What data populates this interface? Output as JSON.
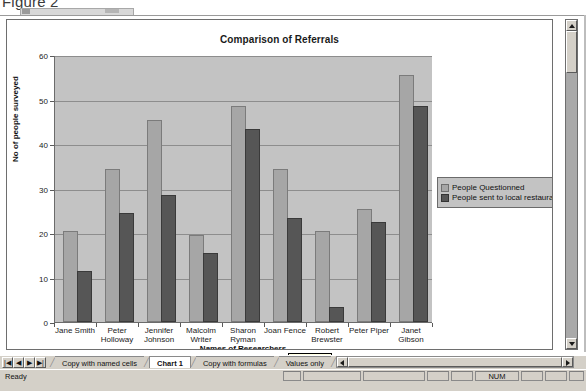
{
  "figure": {
    "caption": "Figure 2"
  },
  "window": {
    "tooltip": "Chart Area"
  },
  "chart_data": {
    "type": "bar",
    "title": "Comparison of Referrals",
    "xlabel": "Names of Researchers",
    "ylabel": "No of people surveyed",
    "ylim": [
      0,
      60
    ],
    "yticks": [
      0,
      10,
      20,
      30,
      40,
      50,
      60
    ],
    "grid": true,
    "legend_position": "right",
    "categories": [
      "Jane Smith",
      "Peter Holloway",
      "Jennifer Johnson",
      "Malcolm Writer",
      "Sharon Ryman",
      "Joan Fence",
      "Robert Brewster",
      "Peter Piper",
      "Janet Gibson"
    ],
    "series": [
      {
        "name": "People Questionned",
        "color": "#a6a6a6",
        "values": [
          20,
          34,
          45,
          19,
          48,
          34,
          20,
          25,
          55
        ]
      },
      {
        "name": "People sent to local restaurant",
        "color": "#565656",
        "values": [
          11,
          24,
          28,
          15,
          43,
          23,
          3,
          22,
          48
        ]
      }
    ]
  },
  "tabbar": {
    "nav": [
      "|◀",
      "◀",
      "▶",
      "▶|"
    ],
    "sheets": [
      {
        "label": "Copy with named cells",
        "active": false
      },
      {
        "label": "Chart 1",
        "active": true
      },
      {
        "label": "Copy with formulas",
        "active": false
      },
      {
        "label": "Values only",
        "active": false
      }
    ]
  },
  "statusbar": {
    "message": "Ready",
    "indicators": [
      "NUM"
    ]
  }
}
